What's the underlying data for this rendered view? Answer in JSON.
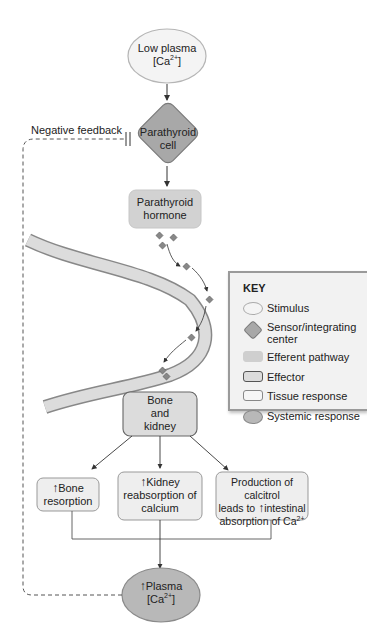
{
  "diagram": {
    "type": "physiology flowchart",
    "stimulus": {
      "line1": "Low plasma",
      "line2_prefix": "[Ca",
      "line2_sup": "2+",
      "line2_suffix": "]"
    },
    "sensor": {
      "line1": "Parathyroid",
      "line2": "cell"
    },
    "efferent": {
      "line1": "Parathyroid",
      "line2": "hormone"
    },
    "effector": {
      "line1": "Bone",
      "line2": "and",
      "line3": "kidney"
    },
    "responses": [
      {
        "arrow": "↑",
        "line1": "Bone",
        "line2": "resorption"
      },
      {
        "arrow": "↑",
        "line1": "Kidney",
        "line2": "reabsorption of",
        "line3": "calcium"
      },
      {
        "line1": "Production of calcitrol",
        "line2_pre": "leads to ",
        "arrow": "↑",
        "line2_post": "intestinal",
        "line3_pre": "absorption of Ca",
        "line3_sup": "2+"
      }
    ],
    "systemic": {
      "arrow": "↑",
      "line1": "Plasma",
      "line2_prefix": "[Ca",
      "line2_sup": "2+",
      "line2_suffix": "]"
    },
    "feedback_label": "Negative feedback"
  },
  "key": {
    "title": "KEY",
    "items": [
      {
        "shape": "ellipse-light",
        "label": "Stimulus"
      },
      {
        "shape": "diamond",
        "label": "Sensor/integrating",
        "label2": "center"
      },
      {
        "shape": "rect-fill",
        "label": "Efferent pathway"
      },
      {
        "shape": "rect-dark-border",
        "label": "Effector"
      },
      {
        "shape": "rect-light",
        "label": "Tissue response"
      },
      {
        "shape": "ellipse-dark",
        "label": "Systemic response"
      }
    ]
  },
  "colors": {
    "stimulus": "#f4f4f4",
    "sensor": "#a8a8a8",
    "efferent": "#cfcfcf",
    "effector": "#dcdcdc",
    "tissue": "#eeeeee",
    "systemic": "#b8b8b8"
  }
}
